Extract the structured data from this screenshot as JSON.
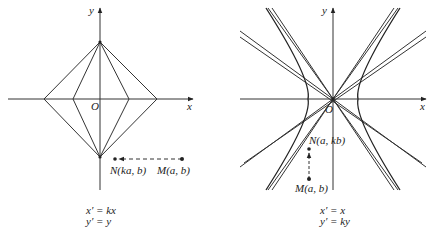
{
  "figures": [
    {
      "id": "left",
      "title": "Horizontal stretch",
      "axis_labels": {
        "x": "x",
        "y": "y",
        "origin": "O"
      },
      "points": [
        {
          "name": "N",
          "label": "N(ka, b)"
        },
        {
          "name": "M",
          "label": "M(a, b)"
        }
      ],
      "equations": [
        "x′ = kx",
        "y′ = y"
      ]
    },
    {
      "id": "right",
      "title": "Vertical stretch",
      "axis_labels": {
        "x": "x",
        "y": "y",
        "origin": "O"
      },
      "points": [
        {
          "name": "N",
          "label": "N(a, kb)"
        },
        {
          "name": "M",
          "label": "M(a, b)"
        }
      ],
      "equations": [
        "x′ = x",
        "y′ = ky"
      ]
    }
  ],
  "colors": {
    "line": "#333333",
    "text": "#222222",
    "background": "#ffffff"
  }
}
